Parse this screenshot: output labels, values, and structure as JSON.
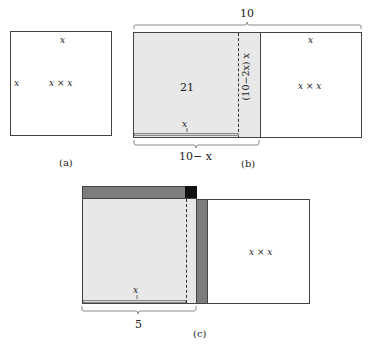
{
  "panel_a": {
    "caption": "(a)",
    "top_label": "x",
    "left_label": "x",
    "center_label": "x × x"
  },
  "panel_b": {
    "caption": "(b)",
    "top_brace_label": "10",
    "area_label": "21",
    "strip_label": "(10−2x) x",
    "bottom_inner_label": "x",
    "bottom_brace_label": "10− x",
    "right_top_label": "x",
    "right_center_label": "x × x"
  },
  "panel_c": {
    "caption": "(c)",
    "bottom_inner_label": "x",
    "bottom_brace_label": "5",
    "right_center_label": "x × x"
  },
  "colors": {
    "shade": "#e8e8e8",
    "dark_strip": "#7d7d7d",
    "corner_square": "#111111",
    "outline": "#444444"
  }
}
